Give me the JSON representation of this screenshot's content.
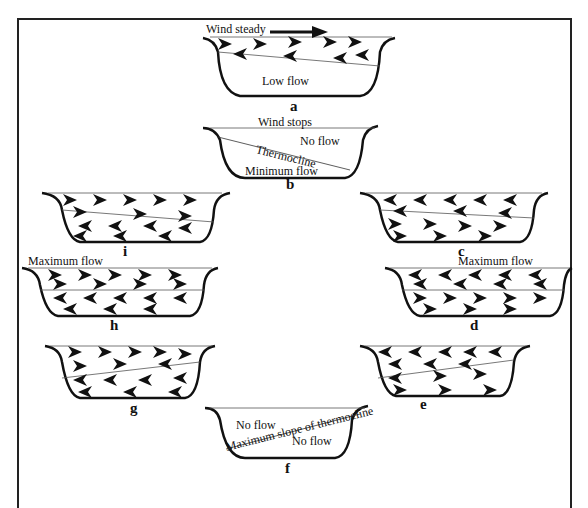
{
  "diagram": {
    "panels": [
      {
        "id": "a",
        "label": "a",
        "texts": {
          "top": "Wind steady",
          "bottom": "Low flow"
        }
      },
      {
        "id": "b",
        "label": "b",
        "texts": {
          "top": "Wind stops",
          "right": "No flow",
          "line": "Thermocline",
          "bottom": "Minimum flow"
        }
      },
      {
        "id": "c",
        "label": "c"
      },
      {
        "id": "d",
        "label": "d",
        "texts": {
          "top": "Maximum flow"
        }
      },
      {
        "id": "e",
        "label": "e"
      },
      {
        "id": "f",
        "label": "f",
        "texts": {
          "left": "No flow",
          "line": "Maximum slope of thermocline",
          "right": "No flow"
        }
      },
      {
        "id": "g",
        "label": "g"
      },
      {
        "id": "h",
        "label": "h",
        "texts": {
          "top": "Maximum flow"
        }
      },
      {
        "id": "i",
        "label": "i"
      }
    ],
    "icons": {
      "wind_arrow": "right-arrow-icon",
      "flow_arrow": "arrowhead-icon"
    }
  }
}
